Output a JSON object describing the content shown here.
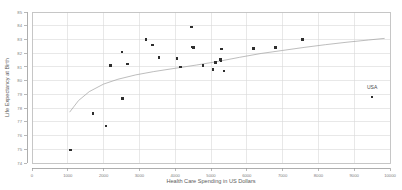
{
  "chart_data": {
    "type": "scatter",
    "title": "",
    "xlabel": "Health Care Spending in US Dollars",
    "ylabel": "Life Expectancy at Birth",
    "xlim": [
      0,
      10000
    ],
    "ylim": [
      74,
      85
    ],
    "xticks": [
      0,
      1000,
      2000,
      3000,
      4000,
      5000,
      6000,
      7000,
      8000,
      9000,
      10000
    ],
    "yticks": [
      74,
      75,
      76,
      77,
      78,
      79,
      80,
      81,
      82,
      83,
      84,
      85
    ],
    "xtick_labels": [
      "0",
      "1000",
      "2000",
      "3000",
      "4000",
      "5000",
      "6000",
      "7000",
      "8000",
      "9000",
      "10000"
    ],
    "ytick_labels": [
      "74",
      "75",
      "76",
      "77",
      "78",
      "79",
      "80",
      "81",
      "82",
      "83",
      "84",
      "85"
    ],
    "grid": true,
    "legend": false,
    "marker_color": "#2e2e2e",
    "marker_shape": "square",
    "grid_color": "#d8d8d8",
    "trend_line_color": "#a0a0a0",
    "points": [
      {
        "x": 1080,
        "y": 74.95,
        "label": ""
      },
      {
        "x": 1700,
        "y": 77.6,
        "label": ""
      },
      {
        "x": 2070,
        "y": 76.7,
        "label": ""
      },
      {
        "x": 2200,
        "y": 81.1,
        "label": ""
      },
      {
        "x": 2510,
        "y": 82.1,
        "label": ""
      },
      {
        "x": 2530,
        "y": 78.7,
        "label": ""
      },
      {
        "x": 2670,
        "y": 81.2,
        "label": ""
      },
      {
        "x": 3180,
        "y": 83.0,
        "label": ""
      },
      {
        "x": 3360,
        "y": 82.6,
        "label": ""
      },
      {
        "x": 3550,
        "y": 81.7,
        "label": ""
      },
      {
        "x": 4050,
        "y": 81.6,
        "label": ""
      },
      {
        "x": 4150,
        "y": 81.0,
        "label": ""
      },
      {
        "x": 4450,
        "y": 83.9,
        "label": ""
      },
      {
        "x": 4480,
        "y": 82.45,
        "label": ""
      },
      {
        "x": 4510,
        "y": 82.4,
        "label": ""
      },
      {
        "x": 4780,
        "y": 81.1,
        "label": ""
      },
      {
        "x": 5060,
        "y": 80.8,
        "label": ""
      },
      {
        "x": 5130,
        "y": 81.3,
        "label": ""
      },
      {
        "x": 5260,
        "y": 81.55,
        "label": ""
      },
      {
        "x": 5280,
        "y": 81.45,
        "label": ""
      },
      {
        "x": 5290,
        "y": 82.3,
        "label": ""
      },
      {
        "x": 5360,
        "y": 80.7,
        "label": ""
      },
      {
        "x": 6180,
        "y": 82.35,
        "label": ""
      },
      {
        "x": 6800,
        "y": 82.4,
        "label": ""
      },
      {
        "x": 7550,
        "y": 83.0,
        "label": ""
      },
      {
        "x": 9500,
        "y": 78.8,
        "label": "USA"
      }
    ],
    "annotations": [
      {
        "text": "USA",
        "x": 9500,
        "y": 79.4
      }
    ],
    "trend": {
      "type": "logarithmic",
      "x_start": 1050,
      "x_end": 9850,
      "points": [
        {
          "x": 1050,
          "y": 77.7
        },
        {
          "x": 1300,
          "y": 78.55
        },
        {
          "x": 1600,
          "y": 79.2
        },
        {
          "x": 2000,
          "y": 79.75
        },
        {
          "x": 2400,
          "y": 80.1
        },
        {
          "x": 2900,
          "y": 80.42
        },
        {
          "x": 3400,
          "y": 80.66
        },
        {
          "x": 4000,
          "y": 80.9
        },
        {
          "x": 4600,
          "y": 81.14
        },
        {
          "x": 5200,
          "y": 81.4
        },
        {
          "x": 5800,
          "y": 81.7
        },
        {
          "x": 6400,
          "y": 81.98
        },
        {
          "x": 7000,
          "y": 82.2
        },
        {
          "x": 7600,
          "y": 82.42
        },
        {
          "x": 8200,
          "y": 82.62
        },
        {
          "x": 8800,
          "y": 82.8
        },
        {
          "x": 9400,
          "y": 82.96
        },
        {
          "x": 9850,
          "y": 83.08
        }
      ]
    }
  }
}
